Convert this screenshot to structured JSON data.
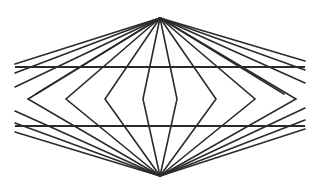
{
  "diagram": {
    "type": "optical-illusion",
    "colors": {
      "background": "#ffffff",
      "stroke": "#2a2a2a"
    },
    "apex_top": [
      160,
      18
    ],
    "apex_bottom": [
      160,
      176
    ],
    "horizontal_lines": [
      {
        "y": 67,
        "x1": 15,
        "x2": 305
      },
      {
        "y": 126,
        "x1": 15,
        "x2": 305
      }
    ],
    "top_fan_endpoints": [
      [
        15,
        64
      ],
      [
        15,
        73
      ],
      [
        15,
        87
      ],
      [
        36,
        94
      ],
      [
        305,
        61
      ],
      [
        305,
        70
      ],
      [
        305,
        83
      ],
      [
        284,
        94
      ]
    ],
    "bottom_fan_endpoints": [
      [
        15,
        111
      ],
      [
        15,
        123
      ],
      [
        15,
        132
      ],
      [
        305,
        108
      ],
      [
        305,
        120
      ],
      [
        305,
        129
      ]
    ],
    "chevrons_left": [
      {
        "vertex": [
          28,
          99
        ],
        "top": [
          50,
          87
        ],
        "bottom": [
          52,
          112
        ]
      },
      {
        "vertex": [
          66,
          99
        ],
        "top": [
          82,
          87
        ],
        "bottom": [
          90,
          112
        ]
      },
      {
        "vertex": [
          105,
          99
        ],
        "top": [
          113,
          87
        ],
        "bottom": [
          124,
          112
        ]
      },
      {
        "vertex": [
          143,
          99
        ],
        "top": [
          145,
          87
        ],
        "bottom": [
          150,
          112
        ]
      }
    ],
    "chevrons_right": [
      {
        "vertex": [
          177,
          99
        ],
        "top": [
          175,
          87
        ],
        "bottom": [
          170,
          112
        ]
      },
      {
        "vertex": [
          216,
          99
        ],
        "top": [
          207,
          87
        ],
        "bottom": [
          196,
          112
        ]
      },
      {
        "vertex": [
          255,
          99
        ],
        "top": [
          238,
          87
        ],
        "bottom": [
          230,
          112
        ]
      },
      {
        "vertex": [
          296,
          99
        ],
        "top": [
          270,
          87
        ],
        "bottom": [
          268,
          112
        ]
      }
    ]
  }
}
